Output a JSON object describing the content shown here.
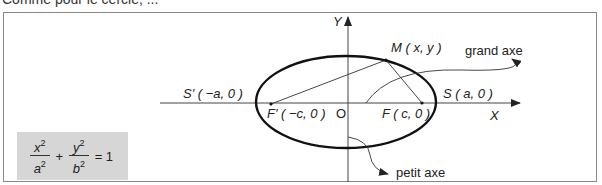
{
  "header": {
    "text": "Comme pour le cercle, ..."
  },
  "diagram": {
    "axis_x_label": "X",
    "axis_y_label": "Y",
    "origin_label": "O",
    "point_m": "M ( x, y )",
    "point_s": "S ( a, 0 )",
    "point_s_prime": "S' ( −a, 0 )",
    "point_f": "F ( c, 0 )",
    "point_f_prime": "F' ( −c, 0 )",
    "grand_axe": "grand axe",
    "petit_axe": "petit axe"
  },
  "formula": {
    "num1": "x",
    "den1": "a",
    "num2": "y",
    "den2": "b",
    "exp": "2",
    "plus": "+",
    "equals": "= 1"
  }
}
